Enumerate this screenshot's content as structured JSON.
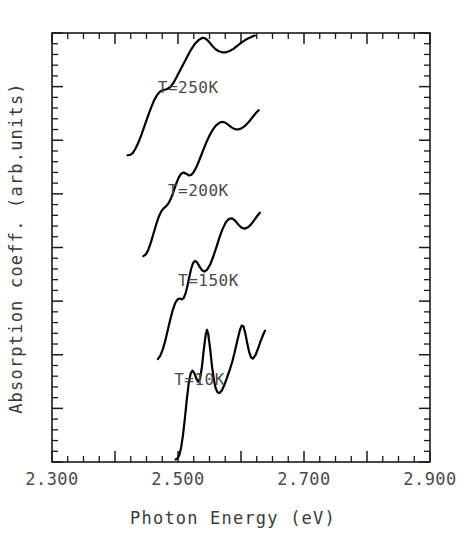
{
  "chart_data": {
    "type": "line",
    "title": "",
    "xlabel": "Photon Energy  (eV)",
    "ylabel": "Absorption coeff.  (arb.units)",
    "xlim": [
      2.3,
      2.9
    ],
    "ylim": [
      0,
      100
    ],
    "grid": false,
    "legend_position": "inline-annotations",
    "x_tick_labels": [
      "2.300",
      "2.500",
      "2.700",
      "2.900"
    ],
    "x_major_ticks": [
      2.3,
      2.4,
      2.5,
      2.6,
      2.7,
      2.8,
      2.9
    ],
    "x_minor_step": 0.025,
    "y_tick_labels": [],
    "y_axis_numbered": false,
    "annotations": [
      {
        "text": "T=250K",
        "x": 2.468,
        "y": 86
      },
      {
        "text": "T=200K",
        "x": 2.484,
        "y": 62
      },
      {
        "text": "T=150K",
        "x": 2.5,
        "y": 41
      },
      {
        "text": "T=10K",
        "x": 2.494,
        "y": 18
      }
    ],
    "series": [
      {
        "name": "T=250K",
        "label": "T=250K",
        "color": "#000000",
        "points": [
          [
            2.42,
            71.5
          ],
          [
            2.424,
            71.6
          ],
          [
            2.428,
            72.0
          ],
          [
            2.432,
            72.9
          ],
          [
            2.437,
            74.4
          ],
          [
            2.442,
            76.3
          ],
          [
            2.447,
            78.4
          ],
          [
            2.452,
            80.5
          ],
          [
            2.457,
            82.5
          ],
          [
            2.462,
            84.3
          ],
          [
            2.467,
            85.6
          ],
          [
            2.472,
            86.4
          ],
          [
            2.477,
            86.7
          ],
          [
            2.482,
            86.9
          ],
          [
            2.487,
            87.3
          ],
          [
            2.492,
            88.2
          ],
          [
            2.497,
            89.5
          ],
          [
            2.503,
            91.2
          ],
          [
            2.509,
            92.9
          ],
          [
            2.515,
            94.6
          ],
          [
            2.521,
            96.2
          ],
          [
            2.527,
            97.5
          ],
          [
            2.533,
            98.4
          ],
          [
            2.539,
            98.9
          ],
          [
            2.544,
            98.7
          ],
          [
            2.549,
            98.0
          ],
          [
            2.554,
            97.1
          ],
          [
            2.559,
            96.3
          ],
          [
            2.564,
            95.8
          ],
          [
            2.57,
            95.5
          ],
          [
            2.576,
            95.5
          ],
          [
            2.582,
            95.8
          ],
          [
            2.588,
            96.3
          ],
          [
            2.594,
            97.0
          ],
          [
            2.6,
            97.7
          ],
          [
            2.606,
            98.3
          ],
          [
            2.612,
            98.8
          ],
          [
            2.618,
            99.2
          ],
          [
            2.622,
            99.4
          ]
        ]
      },
      {
        "name": "T=200K",
        "label": "T=200K",
        "color": "#000000",
        "points": [
          [
            2.445,
            48.0
          ],
          [
            2.449,
            48.4
          ],
          [
            2.453,
            49.5
          ],
          [
            2.457,
            51.2
          ],
          [
            2.461,
            53.2
          ],
          [
            2.465,
            55.2
          ],
          [
            2.469,
            57.0
          ],
          [
            2.473,
            58.3
          ],
          [
            2.477,
            59.1
          ],
          [
            2.481,
            59.6
          ],
          [
            2.485,
            60.3
          ],
          [
            2.489,
            61.5
          ],
          [
            2.493,
            63.1
          ],
          [
            2.497,
            64.8
          ],
          [
            2.501,
            66.3
          ],
          [
            2.505,
            67.2
          ],
          [
            2.509,
            67.5
          ],
          [
            2.513,
            67.2
          ],
          [
            2.517,
            66.8
          ],
          [
            2.521,
            66.9
          ],
          [
            2.525,
            67.6
          ],
          [
            2.53,
            69.0
          ],
          [
            2.535,
            70.8
          ],
          [
            2.54,
            72.7
          ],
          [
            2.545,
            74.5
          ],
          [
            2.55,
            76.1
          ],
          [
            2.555,
            77.4
          ],
          [
            2.56,
            78.4
          ],
          [
            2.565,
            79.0
          ],
          [
            2.57,
            79.3
          ],
          [
            2.575,
            79.1
          ],
          [
            2.58,
            78.6
          ],
          [
            2.585,
            78.0
          ],
          [
            2.59,
            77.6
          ],
          [
            2.595,
            77.5
          ],
          [
            2.6,
            77.7
          ],
          [
            2.606,
            78.3
          ],
          [
            2.612,
            79.2
          ],
          [
            2.618,
            80.3
          ],
          [
            2.624,
            81.4
          ],
          [
            2.628,
            82.0
          ]
        ]
      },
      {
        "name": "T=150K",
        "label": "T=150K",
        "color": "#000000",
        "points": [
          [
            2.468,
            24.0
          ],
          [
            2.472,
            24.8
          ],
          [
            2.476,
            26.3
          ],
          [
            2.48,
            28.4
          ],
          [
            2.484,
            30.9
          ],
          [
            2.488,
            33.4
          ],
          [
            2.492,
            35.6
          ],
          [
            2.496,
            37.2
          ],
          [
            2.5,
            38.0
          ],
          [
            2.503,
            38.1
          ],
          [
            2.506,
            37.9
          ],
          [
            2.509,
            38.2
          ],
          [
            2.512,
            39.3
          ],
          [
            2.515,
            41.1
          ],
          [
            2.518,
            43.2
          ],
          [
            2.521,
            45.1
          ],
          [
            2.524,
            46.4
          ],
          [
            2.527,
            46.9
          ],
          [
            2.53,
            46.6
          ],
          [
            2.534,
            45.6
          ],
          [
            2.538,
            44.7
          ],
          [
            2.542,
            44.4
          ],
          [
            2.546,
            44.8
          ],
          [
            2.551,
            46.0
          ],
          [
            2.556,
            47.9
          ],
          [
            2.561,
            50.1
          ],
          [
            2.566,
            52.4
          ],
          [
            2.571,
            54.4
          ],
          [
            2.576,
            55.9
          ],
          [
            2.581,
            56.7
          ],
          [
            2.586,
            56.8
          ],
          [
            2.591,
            56.2
          ],
          [
            2.596,
            55.3
          ],
          [
            2.601,
            54.6
          ],
          [
            2.606,
            54.4
          ],
          [
            2.611,
            54.7
          ],
          [
            2.616,
            55.4
          ],
          [
            2.621,
            56.4
          ],
          [
            2.626,
            57.4
          ],
          [
            2.63,
            58.1
          ]
        ]
      },
      {
        "name": "T=10K",
        "label": "T=10K",
        "color": "#000000",
        "points": [
          [
            2.496,
            0.6
          ],
          [
            2.499,
            0.8
          ],
          [
            2.502,
            1.6
          ],
          [
            2.505,
            3.4
          ],
          [
            2.508,
            6.4
          ],
          [
            2.511,
            10.3
          ],
          [
            2.514,
            14.6
          ],
          [
            2.517,
            18.3
          ],
          [
            2.52,
            20.6
          ],
          [
            2.523,
            21.3
          ],
          [
            2.526,
            20.7
          ],
          [
            2.529,
            19.5
          ],
          [
            2.532,
            18.7
          ],
          [
            2.535,
            19.4
          ],
          [
            2.538,
            22.2
          ],
          [
            2.541,
            26.3
          ],
          [
            2.544,
            29.7
          ],
          [
            2.546,
            30.8
          ],
          [
            2.548,
            29.8
          ],
          [
            2.551,
            26.4
          ],
          [
            2.554,
            22.3
          ],
          [
            2.557,
            19.1
          ],
          [
            2.56,
            17.1
          ],
          [
            2.563,
            16.2
          ],
          [
            2.566,
            16.1
          ],
          [
            2.57,
            16.8
          ],
          [
            2.574,
            18.1
          ],
          [
            2.578,
            19.7
          ],
          [
            2.582,
            21.4
          ],
          [
            2.586,
            23.3
          ],
          [
            2.59,
            25.6
          ],
          [
            2.594,
            28.2
          ],
          [
            2.598,
            30.6
          ],
          [
            2.601,
            31.8
          ],
          [
            2.604,
            31.6
          ],
          [
            2.607,
            29.9
          ],
          [
            2.61,
            27.6
          ],
          [
            2.613,
            25.6
          ],
          [
            2.616,
            24.4
          ],
          [
            2.619,
            24.1
          ],
          [
            2.623,
            24.9
          ],
          [
            2.627,
            26.4
          ],
          [
            2.631,
            28.1
          ],
          [
            2.635,
            29.6
          ],
          [
            2.638,
            30.6
          ]
        ]
      }
    ]
  },
  "plot": {
    "frame_color": "#1a1a1a",
    "background": "#ffffff"
  }
}
